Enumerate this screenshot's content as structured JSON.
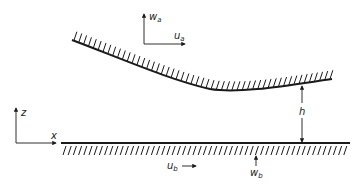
{
  "diagram": {
    "upper_surface": {
      "label": "upper-boundary",
      "velocity_labels": {
        "horizontal": "u",
        "horizontal_sub": "a",
        "vertical": "w",
        "vertical_sub": "a"
      }
    },
    "lower_surface": {
      "label": "lower-boundary",
      "velocity_labels": {
        "horizontal": "u",
        "horizontal_sub": "b",
        "vertical": "w",
        "vertical_sub": "b"
      }
    },
    "axes": {
      "x": "x",
      "z": "z"
    },
    "gap": {
      "label": "h"
    },
    "colors": {
      "line": "#1a1a1a",
      "background": "#ffffff"
    }
  }
}
